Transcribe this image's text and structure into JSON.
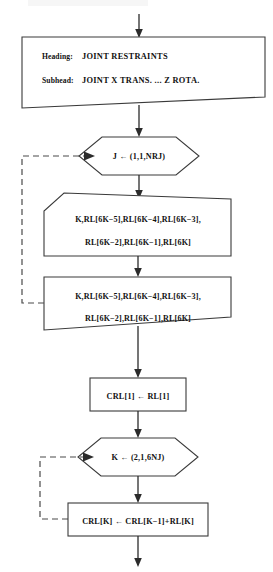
{
  "diagram": {
    "type": "flowchart",
    "accent_color": "#2b2b2b",
    "shape_stroke": "#3a3a3a",
    "background": "#ffffff"
  },
  "nodes": {
    "header_document": {
      "shape": "document",
      "heading_label": "Heading:",
      "heading_value": "JOINT RESTRAINTS",
      "subhead_label": "Subhead:",
      "subhead_value": "JOINT   X TRANS.  ...  Z ROTA."
    },
    "loop_j": {
      "shape": "hexagon",
      "text": "J ← (1,1,NRJ)"
    },
    "io_read": {
      "shape": "punched-card",
      "line1": "K,RL[6K−5],RL[6K−4],RL[6K−3],",
      "line2": "RL[6K−2],RL[6K−1],RL[6K]"
    },
    "io_write": {
      "shape": "document",
      "line1": "K,RL[6K−5],RL[6K−4],RL[6K−3],",
      "line2": "RL[6K−2],RL[6K−1],RL[6K]"
    },
    "assign_crl1": {
      "shape": "rectangle",
      "text": "CRL[1] ← RL[1]"
    },
    "loop_k": {
      "shape": "hexagon",
      "text": "K ← (2,1,6NJ)"
    },
    "assign_crlk": {
      "shape": "rectangle",
      "text": "CRL[K] ← CRL[K−1]+RL[K]"
    }
  },
  "connectors": {
    "entry_arrow": "arrow-down-into-header",
    "header_to_loop_j": "arrow-down",
    "loop_j_to_io_read": "arrow-down",
    "io_read_to_io_write": "arrow-down",
    "io_write_to_assign_crl1": "arrow-down",
    "assign_crl1_to_loop_k": "arrow-down",
    "loop_k_to_assign_crlk": "arrow-down",
    "exit_arrow": "arrow-down-out",
    "loop_j_back_edge": "dashed-left-up-into-loop-j",
    "loop_k_back_edge": "dashed-left-up-into-loop-k"
  }
}
